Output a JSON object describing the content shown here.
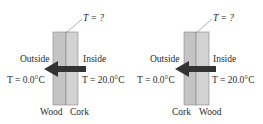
{
  "panels": [
    {
      "temp_query": "T = ?",
      "outside_label": "Outside",
      "inside_label": "Inside",
      "outside_temp": "T = 0.0°C",
      "inside_temp": "T = 20.0°C",
      "left_layer": "Wood",
      "right_layer": "Cork"
    },
    {
      "temp_query": "T = ?",
      "outside_label": "Outside",
      "inside_label": "Inside",
      "outside_temp": "T = 0.0°C",
      "inside_temp": "T = 20.0°C",
      "left_layer": "Cork",
      "right_layer": "Wood"
    }
  ],
  "colors": {
    "wood": "#c8c8c8",
    "cork": "#d6d6d6",
    "arrow": "#333333"
  }
}
